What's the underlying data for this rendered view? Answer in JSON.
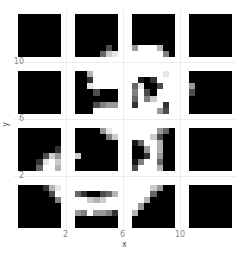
{
  "chart_data": {
    "type": "heatmap",
    "title": "",
    "xlabel": "x",
    "ylabel": "y",
    "x_ticks": [
      "2",
      "6",
      "10"
    ],
    "y_ticks": [
      "2",
      "6",
      "10"
    ],
    "grid": true,
    "legend": "none",
    "colormap": "gray (0=black, 1=white)",
    "facet_layout": {
      "rows": 4,
      "cols": 4
    },
    "panels": [
      {
        "row": 0,
        "col": 0,
        "pixels": [
          [
            0,
            0,
            0,
            0,
            0,
            0,
            0
          ],
          [
            0,
            0,
            0,
            0,
            0,
            0,
            0
          ],
          [
            0,
            0,
            0,
            0,
            0,
            0,
            0
          ],
          [
            0,
            0,
            0,
            0,
            0,
            0,
            0
          ],
          [
            0,
            0,
            0,
            0,
            0,
            0,
            0
          ],
          [
            0,
            0,
            0,
            0,
            0,
            0,
            0
          ],
          [
            0,
            0,
            0,
            0,
            0,
            0,
            0
          ]
        ]
      },
      {
        "row": 0,
        "col": 1,
        "pixels": [
          [
            0,
            0,
            0,
            0,
            0,
            0,
            0
          ],
          [
            0,
            0,
            0,
            0,
            0,
            0,
            0
          ],
          [
            0,
            0,
            0,
            0,
            0,
            0,
            0
          ],
          [
            0,
            0,
            0,
            0,
            0,
            0,
            0
          ],
          [
            0,
            0,
            0,
            0,
            0,
            0,
            0
          ],
          [
            0,
            0,
            0,
            0,
            0,
            0.3,
            0
          ],
          [
            0,
            0,
            0,
            0,
            0.4,
            0.8,
            0.9
          ]
        ]
      },
      {
        "row": 0,
        "col": 2,
        "pixels": [
          [
            0,
            0,
            0,
            0,
            0,
            0,
            0
          ],
          [
            0,
            0,
            0,
            0,
            0,
            0,
            0
          ],
          [
            0,
            0,
            0,
            0,
            0,
            0,
            0
          ],
          [
            0,
            0,
            0,
            0,
            0,
            0,
            0
          ],
          [
            0,
            0,
            0,
            0,
            0,
            0,
            0
          ],
          [
            0.6,
            1,
            1,
            1,
            0.7,
            0,
            0
          ],
          [
            1,
            1,
            1,
            1,
            1,
            0.5,
            0
          ]
        ]
      },
      {
        "row": 0,
        "col": 3,
        "pixels": [
          [
            0,
            0,
            0,
            0,
            0,
            0,
            0
          ],
          [
            0,
            0,
            0,
            0,
            0,
            0,
            0
          ],
          [
            0,
            0,
            0,
            0,
            0,
            0,
            0
          ],
          [
            0,
            0,
            0,
            0,
            0,
            0,
            0
          ],
          [
            0,
            0,
            0,
            0,
            0,
            0,
            0
          ],
          [
            0,
            0,
            0,
            0,
            0,
            0,
            0
          ],
          [
            0,
            0,
            0,
            0,
            0,
            0,
            0
          ]
        ]
      },
      {
        "row": 1,
        "col": 0,
        "pixels": [
          [
            0,
            0,
            0,
            0,
            0,
            0,
            0
          ],
          [
            0,
            0,
            0,
            0,
            0,
            0,
            0
          ],
          [
            0,
            0,
            0,
            0,
            0,
            0,
            0
          ],
          [
            0,
            0,
            0,
            0,
            0,
            0,
            0
          ],
          [
            0,
            0,
            0,
            0,
            0,
            0,
            0
          ],
          [
            0,
            0,
            0,
            0,
            0,
            0,
            0
          ],
          [
            0,
            0,
            0,
            0,
            0,
            0,
            0
          ]
        ]
      },
      {
        "row": 1,
        "col": 1,
        "pixels": [
          [
            0,
            0,
            0.7,
            1,
            1,
            1,
            1
          ],
          [
            0,
            0,
            0.2,
            1,
            1,
            1,
            1
          ],
          [
            0,
            0,
            0.9,
            1,
            1,
            1,
            1
          ],
          [
            0,
            0,
            0,
            0.3,
            0,
            0,
            0
          ],
          [
            0,
            0,
            0,
            0,
            0,
            0,
            0
          ],
          [
            0,
            0,
            0,
            0.3,
            0.5,
            0.6,
            0.6
          ],
          [
            0,
            0,
            0,
            1,
            1,
            1,
            1
          ]
        ]
      },
      {
        "row": 1,
        "col": 2,
        "pixels": [
          [
            1,
            1,
            1,
            1,
            1,
            0.9,
            1
          ],
          [
            1,
            0.1,
            0,
            0.2,
            1,
            1,
            1
          ],
          [
            0.4,
            0.9,
            0,
            0,
            0.3,
            1,
            1
          ],
          [
            0.5,
            1,
            0.3,
            0,
            1,
            1,
            1
          ],
          [
            0.4,
            1,
            0.5,
            0.8,
            1,
            1,
            1
          ],
          [
            0.2,
            1,
            1,
            1,
            1,
            0.2,
            1
          ],
          [
            1,
            1,
            1,
            1,
            0.6,
            0.3,
            1
          ]
        ]
      },
      {
        "row": 1,
        "col": 3,
        "pixels": [
          [
            0,
            0,
            0,
            0,
            0,
            0,
            0
          ],
          [
            0,
            0,
            0,
            0,
            0,
            0,
            0
          ],
          [
            0.6,
            0,
            0,
            0,
            0,
            0,
            0
          ],
          [
            0.3,
            0,
            0,
            0,
            0,
            0,
            0
          ],
          [
            0,
            0,
            0,
            0,
            0,
            0,
            0
          ],
          [
            0,
            0,
            0,
            0,
            0,
            0,
            0
          ],
          [
            0,
            0,
            0,
            0,
            0,
            0,
            0
          ]
        ]
      },
      {
        "row": 2,
        "col": 0,
        "pixels": [
          [
            0,
            0,
            0,
            0,
            0,
            0,
            0
          ],
          [
            0,
            0,
            0,
            0,
            0,
            0,
            0
          ],
          [
            0,
            0,
            0,
            0,
            0,
            0,
            0
          ],
          [
            0,
            0,
            0,
            0,
            0,
            0,
            0.2
          ],
          [
            0,
            0,
            0,
            0,
            0.3,
            0.8,
            0.6
          ],
          [
            0,
            0,
            0,
            0.2,
            0.9,
            1,
            0.8
          ],
          [
            0,
            0,
            0,
            0.4,
            1,
            1,
            0.7
          ]
        ]
      },
      {
        "row": 2,
        "col": 1,
        "pixels": [
          [
            0,
            0,
            0,
            0,
            0.6,
            0.9,
            1
          ],
          [
            0,
            0,
            0,
            0,
            0,
            0.5,
            0.8
          ],
          [
            0,
            0,
            0,
            0,
            0,
            0,
            0
          ],
          [
            0,
            0,
            0,
            0,
            0,
            0,
            0
          ],
          [
            0.8,
            0,
            0,
            0,
            0,
            0,
            0
          ],
          [
            0,
            0,
            0,
            0,
            0,
            0,
            0
          ],
          [
            0,
            0,
            0,
            0,
            0,
            0,
            0
          ]
        ]
      },
      {
        "row": 2,
        "col": 2,
        "pixels": [
          [
            1,
            1,
            1,
            1,
            0.6,
            0.4,
            0
          ],
          [
            1,
            1,
            1,
            0.8,
            0.3,
            0,
            0
          ],
          [
            0.1,
            0.4,
            1,
            1,
            0.7,
            0,
            0
          ],
          [
            0,
            0,
            0.6,
            1,
            0.7,
            0,
            0
          ],
          [
            0,
            0,
            0.2,
            1,
            0.6,
            0,
            0
          ],
          [
            0.1,
            0.5,
            1,
            1,
            0.4,
            0,
            0
          ],
          [
            0.3,
            1,
            1,
            1,
            0.7,
            0,
            0
          ]
        ]
      },
      {
        "row": 2,
        "col": 3,
        "pixels": [
          [
            0,
            0,
            0,
            0,
            0,
            0,
            0
          ],
          [
            0,
            0,
            0,
            0,
            0,
            0,
            0
          ],
          [
            0,
            0,
            0,
            0,
            0,
            0,
            0
          ],
          [
            0,
            0,
            0,
            0,
            0,
            0,
            0
          ],
          [
            0,
            0,
            0,
            0,
            0,
            0,
            0
          ],
          [
            0,
            0,
            0,
            0,
            0,
            0,
            0
          ],
          [
            0,
            0,
            0,
            0,
            0,
            0,
            0
          ]
        ]
      },
      {
        "row": 3,
        "col": 0,
        "pixels": [
          [
            0,
            0,
            0,
            0,
            0.2,
            0.7,
            0.9
          ],
          [
            0,
            0,
            0,
            0,
            0,
            0.3,
            1
          ],
          [
            0,
            0,
            0,
            0,
            0,
            0,
            0.5
          ],
          [
            0,
            0,
            0,
            0,
            0,
            0,
            0
          ],
          [
            0,
            0,
            0,
            0,
            0,
            0,
            0
          ],
          [
            0,
            0,
            0,
            0,
            0,
            0,
            0
          ],
          [
            0,
            0,
            0,
            0,
            0,
            0,
            0
          ]
        ]
      },
      {
        "row": 3,
        "col": 1,
        "pixels": [
          [
            1,
            1,
            1,
            1,
            1,
            1,
            1
          ],
          [
            0.4,
            0.2,
            0,
            0,
            0.3,
            0.4,
            0.7
          ],
          [
            1,
            1,
            0.8,
            0.7,
            0.8,
            1,
            1
          ],
          [
            1,
            1,
            1,
            1,
            1,
            1,
            1
          ],
          [
            0.6,
            0.5,
            1,
            0.6,
            0.6,
            0.5,
            0.2
          ],
          [
            0,
            0,
            0,
            0,
            0,
            0,
            0
          ],
          [
            0,
            0,
            0,
            0,
            0,
            0,
            0
          ]
        ]
      },
      {
        "row": 3,
        "col": 2,
        "pixels": [
          [
            1,
            1,
            1,
            0.8,
            0.6,
            0,
            0
          ],
          [
            1,
            1,
            1,
            0.4,
            0,
            0,
            0
          ],
          [
            1,
            1,
            0.7,
            0,
            0,
            0,
            0
          ],
          [
            1,
            0.6,
            0,
            0,
            0,
            0,
            0
          ],
          [
            0.7,
            0,
            0,
            0,
            0,
            0,
            0
          ],
          [
            0,
            0,
            0,
            0,
            0,
            0,
            0
          ],
          [
            0,
            0,
            0,
            0,
            0,
            0,
            0
          ]
        ]
      },
      {
        "row": 3,
        "col": 3,
        "pixels": [
          [
            0,
            0,
            0,
            0,
            0,
            0,
            0
          ],
          [
            0,
            0,
            0,
            0,
            0,
            0,
            0
          ],
          [
            0,
            0,
            0,
            0,
            0,
            0,
            0
          ],
          [
            0,
            0,
            0,
            0,
            0,
            0,
            0
          ],
          [
            0,
            0,
            0,
            0,
            0,
            0,
            0
          ],
          [
            0,
            0,
            0,
            0,
            0,
            0,
            0
          ],
          [
            0,
            0,
            0,
            0,
            0,
            0,
            0
          ]
        ]
      }
    ]
  },
  "axes": {
    "xlabel": "x",
    "ylabel": "y",
    "x_ticks": [
      {
        "label": "2",
        "left": 63
      },
      {
        "label": "6",
        "left": 120
      },
      {
        "label": "10",
        "left": 177
      }
    ],
    "y_ticks": [
      {
        "label": "10",
        "top": 62
      },
      {
        "label": "6",
        "top": 119
      },
      {
        "label": "2",
        "top": 176
      }
    ]
  },
  "layout": {
    "panel_left": [
      18,
      75,
      132,
      189
    ],
    "panel_top": [
      14,
      71,
      128,
      185
    ],
    "panel_size": 43
  }
}
